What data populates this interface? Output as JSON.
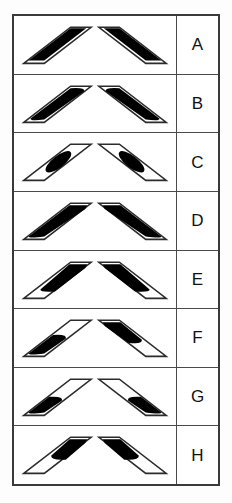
{
  "figure": {
    "kind": "paired-parallelogram-shading-chart",
    "row_count": 8,
    "shapes_per_row": 2,
    "colors": {
      "ink": "#000000",
      "outline": "#3a3a3a",
      "rule": "#4a4a4a",
      "paper": "#ffffff",
      "fill": "#000000"
    },
    "label_column": {
      "name": "answer-option-letters",
      "width_px": 42
    },
    "rows": [
      {
        "label": "A",
        "left": {
          "orientation": "ascending",
          "fill": "full-bar-straight",
          "fill_shape": "rectangular-band",
          "rounded": false
        },
        "right": {
          "orientation": "descending",
          "fill": "full-bar-straight",
          "fill_shape": "rectangular-band",
          "rounded": false
        }
      },
      {
        "label": "B",
        "left": {
          "orientation": "ascending",
          "fill": "full-bar-rounded",
          "fill_shape": "lozenge",
          "rounded": true
        },
        "right": {
          "orientation": "descending",
          "fill": "full-bar-rounded",
          "fill_shape": "lozenge",
          "rounded": true
        }
      },
      {
        "label": "C",
        "left": {
          "orientation": "ascending",
          "fill": "center-blob",
          "fill_shape": "short-oval",
          "rounded": true
        },
        "right": {
          "orientation": "descending",
          "fill": "center-blob",
          "fill_shape": "short-oval",
          "rounded": true
        }
      },
      {
        "label": "D",
        "left": {
          "orientation": "ascending",
          "fill": "full-bar-tapered",
          "fill_shape": "tapered-band",
          "rounded": true
        },
        "right": {
          "orientation": "descending",
          "fill": "full-bar-tapered",
          "fill_shape": "tapered-band",
          "rounded": true
        }
      },
      {
        "label": "E",
        "left": {
          "orientation": "ascending",
          "fill": "upper-two-thirds",
          "fill_shape": "tapered-band",
          "rounded": true
        },
        "right": {
          "orientation": "descending",
          "fill": "upper-two-thirds",
          "fill_shape": "tapered-band",
          "rounded": true
        }
      },
      {
        "label": "F",
        "left": {
          "orientation": "ascending",
          "fill": "lower-half",
          "fill_shape": "tapered-band",
          "rounded": true
        },
        "right": {
          "orientation": "descending",
          "fill": "upper-half",
          "fill_shape": "tapered-band",
          "rounded": true
        }
      },
      {
        "label": "G",
        "left": {
          "orientation": "ascending",
          "fill": "lower-third",
          "fill_shape": "stub",
          "rounded": true
        },
        "right": {
          "orientation": "descending",
          "fill": "lower-third",
          "fill_shape": "stub",
          "rounded": true
        }
      },
      {
        "label": "H",
        "left": {
          "orientation": "ascending",
          "fill": "upper-third",
          "fill_shape": "stub",
          "rounded": true
        },
        "right": {
          "orientation": "descending",
          "fill": "upper-third",
          "fill_shape": "stub",
          "rounded": true
        }
      }
    ]
  }
}
